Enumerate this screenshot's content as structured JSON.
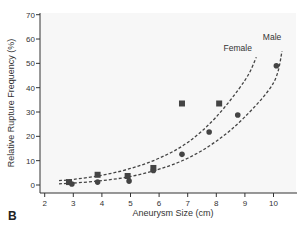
{
  "figure": {
    "panel_label": "B"
  },
  "chart_data": {
    "type": "scatter",
    "title": "",
    "xlabel": "Aneurysm Size (cm)",
    "ylabel": "Relative Rupture Frequency (%)",
    "xlim": [
      1.8,
      10.9
    ],
    "ylim": [
      -3,
      70
    ],
    "xticks": [
      2,
      3,
      4,
      5,
      6,
      7,
      8,
      9,
      10
    ],
    "yticks": [
      0,
      10,
      20,
      30,
      40,
      50,
      60,
      70
    ],
    "grid": false,
    "legend": "inline curve labels",
    "series": [
      {
        "name": "Female",
        "marker": "square",
        "points": [
          {
            "x": 2.85,
            "y": 1.2
          },
          {
            "x": 3.85,
            "y": 4.2
          },
          {
            "x": 4.9,
            "y": 3.7
          },
          {
            "x": 5.8,
            "y": 7.0
          },
          {
            "x": 6.8,
            "y": 33.5
          },
          {
            "x": 8.1,
            "y": 33.5
          }
        ],
        "fit_curve": {
          "style": "dashed",
          "label": "Female",
          "x": [
            2.5,
            3,
            4,
            5,
            6,
            7,
            8,
            9,
            9.4
          ],
          "y": [
            1.8,
            2.3,
            4.0,
            6.8,
            11.0,
            17.5,
            28.0,
            43.0,
            52.5
          ]
        }
      },
      {
        "name": "Male",
        "marker": "circle",
        "points": [
          {
            "x": 2.95,
            "y": 0.4
          },
          {
            "x": 3.85,
            "y": 1.2
          },
          {
            "x": 4.95,
            "y": 1.6
          },
          {
            "x": 5.8,
            "y": 6.0
          },
          {
            "x": 6.8,
            "y": 12.6
          },
          {
            "x": 7.75,
            "y": 21.8
          },
          {
            "x": 8.75,
            "y": 28.8
          },
          {
            "x": 10.1,
            "y": 49.0
          }
        ],
        "fit_curve": {
          "style": "dashed",
          "label": "Male",
          "x": [
            2.5,
            3,
            4,
            5,
            6,
            7,
            8,
            9,
            10,
            10.3
          ],
          "y": [
            0.5,
            0.8,
            1.8,
            3.5,
            6.5,
            11.0,
            18.0,
            28.0,
            42.0,
            55.0
          ]
        }
      }
    ],
    "annotations": [
      {
        "text": "Female",
        "x": 8.75,
        "y": 55
      },
      {
        "text": "Male",
        "x": 9.95,
        "y": 59.5
      }
    ]
  },
  "colors": {
    "plot_background": "#f7f7f7",
    "axis": "#333333",
    "markers": "#444444",
    "curves": "#444444"
  }
}
